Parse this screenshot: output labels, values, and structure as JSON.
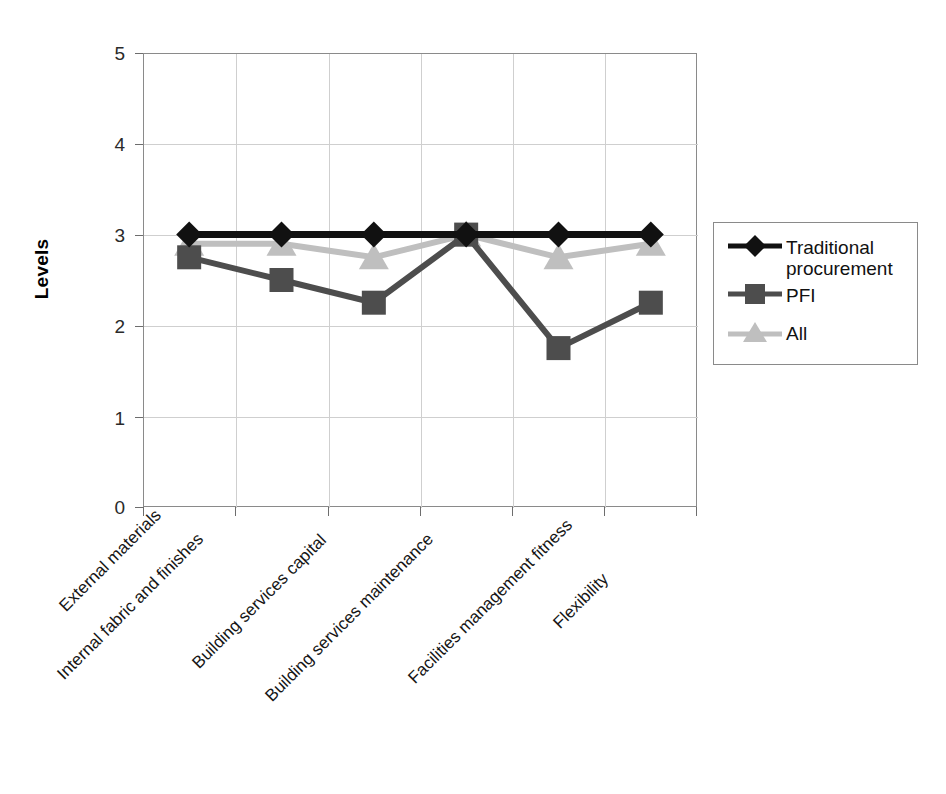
{
  "chart_data": {
    "type": "line",
    "title": "",
    "xlabel": "",
    "ylabel": "Levels",
    "ylim": [
      0,
      5
    ],
    "ytick_labels": [
      "0",
      "1",
      "2",
      "3",
      "4",
      "5"
    ],
    "grid": true,
    "legend_position": "right",
    "categories": [
      "External materials",
      "Internal fabric and finishes",
      "Building services capital",
      "Building services maintenance",
      "Facilities management fitness",
      "Flexibility"
    ],
    "series": [
      {
        "name": "Traditional procurement",
        "marker": "diamond",
        "color": "#111111",
        "values": [
          3.0,
          3.0,
          3.0,
          3.0,
          3.0,
          3.0
        ]
      },
      {
        "name": "PFI",
        "marker": "square",
        "color": "#4d4d4d",
        "values": [
          2.75,
          2.5,
          2.25,
          3.0,
          1.75,
          2.25
        ]
      },
      {
        "name": "All",
        "marker": "triangle",
        "color": "#bfbfbf",
        "values": [
          2.9,
          2.9,
          2.75,
          3.0,
          2.75,
          2.9
        ]
      }
    ]
  },
  "axis": {
    "y_title": "Levels",
    "ticks": [
      "5",
      "4",
      "3",
      "2",
      "1",
      "0"
    ]
  },
  "legend": {
    "entries": [
      {
        "label_line1": "Traditional",
        "label_line2": "procurement"
      },
      {
        "label_line1": "PFI",
        "label_line2": ""
      },
      {
        "label_line1": "All",
        "label_line2": ""
      }
    ]
  },
  "colors": {
    "traditional": "#111111",
    "pfi": "#4d4d4d",
    "all": "#bfbfbf",
    "grid": "#cfcfcf",
    "axis": "#8a8a8a"
  }
}
